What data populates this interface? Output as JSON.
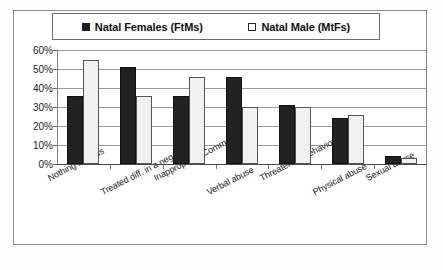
{
  "chart_data": {
    "type": "bar",
    "title": "",
    "xlabel": "",
    "ylabel": "",
    "ylim": [
      0,
      60
    ],
    "ytick_labels": [
      "60%",
      "50%",
      "40%",
      "30%",
      "20%",
      "10%",
      "0%"
    ],
    "ytick_values": [
      60,
      50,
      40,
      30,
      20,
      10,
      0
    ],
    "grid": true,
    "legend_position": "top",
    "categories": [
      "Nothing like this",
      "Treated diff. in a neg. way",
      "Inappropriate Comments",
      "Verbal abuse",
      "Threatening behaviour",
      "Physical abuse",
      "Sexual abuse"
    ],
    "series": [
      {
        "name": "Natal Females (FtMs)",
        "color": "#222222",
        "swatch": "filled",
        "values": [
          36,
          51,
          36,
          46,
          31,
          24,
          4
        ]
      },
      {
        "name": "Natal Male (MtFs)",
        "color": "#f1f1f1",
        "swatch": "hollow",
        "values": [
          55,
          36,
          46,
          30,
          30,
          26,
          3
        ]
      }
    ]
  },
  "legend": {
    "entries": [
      {
        "label": "Natal Females (FtMs)",
        "swatch": "filled"
      },
      {
        "label": "Natal Male (MtFs)",
        "swatch": "hollow"
      }
    ]
  },
  "colors": {
    "series_a": "#222222",
    "series_b": "#f1f1f1",
    "gridline": "#9a9a9a",
    "axis": "#4a4a4a",
    "frame": "#8f8f8f"
  }
}
